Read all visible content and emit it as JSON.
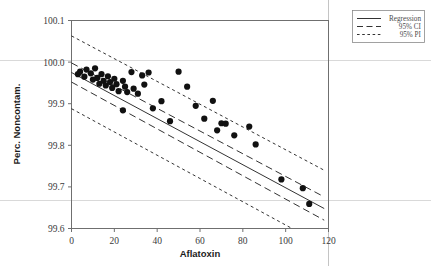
{
  "chart_data": {
    "type": "scatter",
    "title": "",
    "xlabel": "Aflatoxin",
    "ylabel": "Perc. Noncontam.",
    "xlim": [
      0,
      120
    ],
    "ylim": [
      99.6,
      100.1
    ],
    "xticks": [
      0,
      20,
      40,
      60,
      80,
      100,
      120
    ],
    "xtick_labels": [
      "0",
      "20",
      "40",
      "60",
      "80",
      "100",
      "120"
    ],
    "yticks": [
      99.6,
      99.7,
      99.8,
      99.9,
      100.0,
      100.1
    ],
    "ytick_labels": [
      "99.6",
      "99.7",
      "99.8",
      "99.9",
      "100.0",
      "100.1"
    ],
    "grid": false,
    "legend_position": "top-right",
    "legend": [
      {
        "label": "Regression",
        "style": "solid"
      },
      {
        "label": "95% CI",
        "style": "long-dash"
      },
      {
        "label": "95% PI",
        "style": "short-dash"
      }
    ],
    "points": [
      {
        "x": 3,
        "y": 99.971
      },
      {
        "x": 4,
        "y": 99.977
      },
      {
        "x": 6,
        "y": 99.965
      },
      {
        "x": 7,
        "y": 99.982
      },
      {
        "x": 9,
        "y": 99.973
      },
      {
        "x": 10,
        "y": 99.958
      },
      {
        "x": 11,
        "y": 99.985
      },
      {
        "x": 12,
        "y": 99.962
      },
      {
        "x": 13,
        "y": 99.948
      },
      {
        "x": 14,
        "y": 99.971
      },
      {
        "x": 15,
        "y": 99.955
      },
      {
        "x": 16,
        "y": 99.944
      },
      {
        "x": 17,
        "y": 99.966
      },
      {
        "x": 18,
        "y": 99.952
      },
      {
        "x": 19,
        "y": 99.938
      },
      {
        "x": 20,
        "y": 99.96
      },
      {
        "x": 21,
        "y": 99.947
      },
      {
        "x": 22,
        "y": 99.93
      },
      {
        "x": 24,
        "y": 99.955
      },
      {
        "x": 25,
        "y": 99.941
      },
      {
        "x": 26,
        "y": 99.928
      },
      {
        "x": 28,
        "y": 99.976
      },
      {
        "x": 29,
        "y": 99.936
      },
      {
        "x": 31,
        "y": 99.924
      },
      {
        "x": 33,
        "y": 99.968
      },
      {
        "x": 34,
        "y": 99.946
      },
      {
        "x": 36,
        "y": 99.975
      },
      {
        "x": 38,
        "y": 99.889
      },
      {
        "x": 24,
        "y": 99.884
      },
      {
        "x": 42,
        "y": 99.906
      },
      {
        "x": 46,
        "y": 99.858
      },
      {
        "x": 50,
        "y": 99.977
      },
      {
        "x": 54,
        "y": 99.941
      },
      {
        "x": 58,
        "y": 99.895
      },
      {
        "x": 62,
        "y": 99.864
      },
      {
        "x": 66,
        "y": 99.907
      },
      {
        "x": 68,
        "y": 99.836
      },
      {
        "x": 70,
        "y": 99.853
      },
      {
        "x": 72,
        "y": 99.852
      },
      {
        "x": 76,
        "y": 99.824
      },
      {
        "x": 83,
        "y": 99.845
      },
      {
        "x": 86,
        "y": 99.802
      },
      {
        "x": 98,
        "y": 99.718
      },
      {
        "x": 108,
        "y": 99.697
      },
      {
        "x": 111,
        "y": 99.659
      }
    ],
    "regression": {
      "x_start": 0,
      "y_start": 99.975,
      "x_end": 118,
      "y_end": 99.648
    },
    "ci_upper": {
      "x_start": 0,
      "y_start": 99.998,
      "x_end": 118,
      "y_end": 99.676
    },
    "ci_lower": {
      "x_start": 0,
      "y_start": 99.952,
      "x_end": 118,
      "y_end": 99.62
    },
    "pi_upper": {
      "x_start": 0,
      "y_start": 100.063,
      "x_end": 118,
      "y_end": 99.74
    },
    "pi_lower": {
      "x_start": 0,
      "y_start": 99.888,
      "x_end": 118,
      "y_end": 99.558
    }
  },
  "colors": {
    "data_point": "#111111",
    "line": "#1c1c1c",
    "frame": "#6f6f6f",
    "artifact": "#cfcfcf",
    "background": "#ffffff"
  }
}
